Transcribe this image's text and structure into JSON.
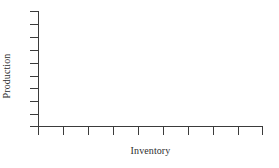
{
  "chart_data": {
    "type": "scatter",
    "title": "",
    "subtitle": "",
    "xlabel": "Inventory",
    "ylabel": "Production",
    "series": [
      {
        "name": "",
        "x": [],
        "y": [],
        "values": []
      }
    ],
    "x": [],
    "values": [],
    "categories": [],
    "xtick_labels": [
      "",
      "",
      "",
      "",
      "",
      "",
      "",
      "",
      "",
      ""
    ],
    "ytick_labels": [
      "",
      "",
      "",
      "",
      "",
      "",
      "",
      "",
      "",
      ""
    ],
    "xtick_count": 10,
    "ytick_count": 10,
    "xlim": [
      0,
      10
    ],
    "ylim": [
      0,
      10
    ],
    "grid": false,
    "legend": null,
    "legend_position": "none",
    "annotations": [],
    "colors": {
      "axis": "#3b3b3b",
      "tick": "#3b3b3b",
      "text": "#2e2e2e",
      "background": "#ffffff",
      "plot_background": "#ffffff"
    }
  },
  "axes": {
    "y": {
      "label": "Production",
      "tick_positions_px": [
        11,
        24,
        37,
        50,
        63,
        76,
        88,
        101,
        114,
        126
      ],
      "tick_length_px": 8,
      "direction": "left"
    },
    "x": {
      "label": "Inventory",
      "tick_positions_px": [
        38,
        63,
        88,
        113,
        138,
        163,
        188,
        213,
        238,
        262
      ],
      "tick_length_px": 8,
      "direction": "down"
    }
  }
}
